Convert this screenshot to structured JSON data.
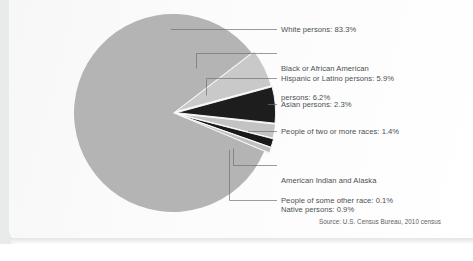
{
  "chart_data": {
    "type": "pie",
    "title": "",
    "subtitle": "",
    "source": "Source: U.S. Census Bureau, 2010 census",
    "legend_position": "right-callouts",
    "grid": false,
    "unit": "%",
    "total": 100.1,
    "categories": [
      "White persons",
      "Black or African American persons",
      "Hispanic or Latino persons",
      "Asian persons",
      "People of two or more races",
      "American Indian and Alaska Native persons",
      "People of some other race"
    ],
    "values": [
      83.3,
      6.2,
      5.9,
      2.3,
      1.4,
      0.9,
      0.1
    ],
    "colors": [
      "#b4b4b4",
      "#c9c9c9",
      "#1d1d1d",
      "#c3c3c3",
      "#191919",
      "#c0c0c0",
      "#9a9a9a"
    ],
    "slices": [
      {
        "label": "White persons",
        "value": 83.3,
        "value_text": "83.3%",
        "color": "#b4b4b4"
      },
      {
        "label": "Black or African American persons",
        "value": 6.2,
        "value_text": "6.2%",
        "color": "#c9c9c9"
      },
      {
        "label": "Hispanic or Latino persons",
        "value": 5.9,
        "value_text": "5.9%",
        "color": "#1d1d1d"
      },
      {
        "label": "Asian persons",
        "value": 2.3,
        "value_text": "2.3%",
        "color": "#c3c3c3"
      },
      {
        "label": "People of two or more races",
        "value": 1.4,
        "value_text": "1.4%",
        "color": "#191919"
      },
      {
        "label": "American Indian and Alaska Native persons",
        "value": 0.9,
        "value_text": "0.9%",
        "color": "#c0c0c0"
      },
      {
        "label": "People of some other race",
        "value": 0.1,
        "value_text": "0.1%",
        "color": "#9a9a9a"
      }
    ]
  },
  "callouts": {
    "white": "White persons: 83.3%",
    "black_line1": "Black or African American",
    "black_line2": "persons: 6.2%",
    "hispanic": "Hispanic or Latino persons: 5.9%",
    "asian": "Asian persons: 2.3%",
    "two_or_more": "People of two or more races: 1.4%",
    "native_line1": "American Indian and Alaska",
    "native_line2": "Native persons: 0.9%",
    "other": "People of some other race: 0.1%"
  },
  "footer": {
    "source": "Source: U.S. Census Bureau, 2010 census"
  }
}
